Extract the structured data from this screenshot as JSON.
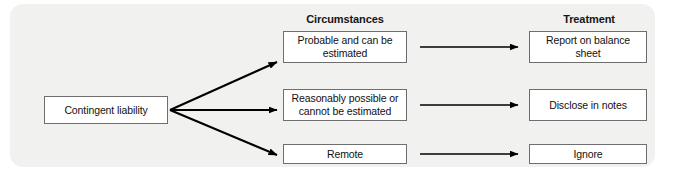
{
  "panel": {
    "background_color": "#f1f1f0"
  },
  "headers": {
    "circumstances": "Circumstances",
    "treatment": "Treatment"
  },
  "source": {
    "label": "Contingent liability"
  },
  "rows": [
    {
      "circumstance": "Probable and can be estimated",
      "treatment": "Report on balance sheet"
    },
    {
      "circumstance": "Reasonably possible or cannot be estimated",
      "treatment": "Disclose in notes"
    },
    {
      "circumstance": "Remote",
      "treatment": "Ignore"
    }
  ],
  "style": {
    "box_border_color": "#6e6e6e",
    "box_fill_color": "#ffffff",
    "arrow_color": "#000000",
    "text_color": "#111111"
  }
}
